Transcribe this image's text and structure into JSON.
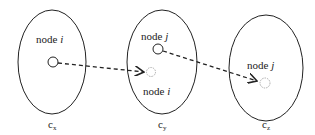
{
  "diagram": {
    "clusters": [
      {
        "id": "cx",
        "label": "c",
        "subscript": "x",
        "node_label": "node",
        "node_var": "i"
      },
      {
        "id": "cy",
        "label": "c",
        "subscript": "y",
        "node_labels": [
          {
            "text": "node",
            "var": "j"
          },
          {
            "text": "node",
            "var": "i"
          }
        ]
      },
      {
        "id": "cz",
        "label": "c",
        "subscript": "z",
        "node_label": "node",
        "node_var": "j"
      }
    ],
    "arrows": [
      {
        "from": "node i in c_x",
        "to": "node i in c_y",
        "style": "dashed"
      },
      {
        "from": "node j in c_y",
        "to": "node j in c_z",
        "style": "dashed"
      }
    ],
    "colors": {
      "stroke": "#222222",
      "ghost": "#999999"
    }
  }
}
